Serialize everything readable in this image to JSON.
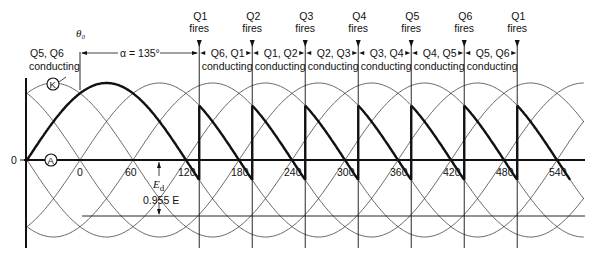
{
  "figure": {
    "theta0_label": "θ₀",
    "alpha_label": "α = 135°",
    "initial_state": {
      "line1": "Q5, Q6",
      "line2": "conducting"
    },
    "zero_label": "0",
    "point_K": "K",
    "point_A": "A",
    "ed_label": "E",
    "ed_sub": "d",
    "ed_value": "0.955 E",
    "fires": [
      {
        "q": "Q1",
        "word": "fires"
      },
      {
        "q": "Q2",
        "word": "fires"
      },
      {
        "q": "Q3",
        "word": "fires"
      },
      {
        "q": "Q4",
        "word": "fires"
      },
      {
        "q": "Q5",
        "word": "fires"
      },
      {
        "q": "Q6",
        "word": "fires"
      },
      {
        "q": "Q1",
        "word": "fires"
      }
    ],
    "conducting": [
      {
        "pair": "Q6, Q1",
        "word": "conducting"
      },
      {
        "pair": "Q1, Q2",
        "word": "conducting"
      },
      {
        "pair": "Q2, Q3",
        "word": "conducting"
      },
      {
        "pair": "Q3, Q4",
        "word": "conducting"
      },
      {
        "pair": "Q4, Q5",
        "word": "conducting"
      },
      {
        "pair": "Q5, Q6",
        "word": "conducting"
      }
    ],
    "x_ticks": [
      "0",
      "60",
      "120",
      "180",
      "240",
      "300",
      "360",
      "420",
      "480",
      "540"
    ]
  },
  "geometry": {
    "x0_px": 80,
    "px_per_deg": 0.8833,
    "zero_y": 160,
    "amplitude_px": 77,
    "alpha_deg": 135,
    "ed_line_y": 216
  }
}
